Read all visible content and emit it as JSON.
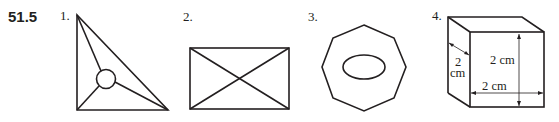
{
  "problem": {
    "number": "51.5"
  },
  "figures": [
    {
      "label": "1.",
      "shape": "triangle-with-inscribed-circle-and-lines-to-vertices"
    },
    {
      "label": "2.",
      "shape": "rectangle-with-diagonals"
    },
    {
      "label": "3.",
      "shape": "octagon-with-ellipse"
    },
    {
      "label": "4.",
      "shape": "cube",
      "dimensions": {
        "height": "2 cm",
        "width": "2 cm",
        "depth_value": "2",
        "depth_unit": "cm"
      }
    }
  ],
  "colors": {
    "ink": "#231f20",
    "background": "#ffffff"
  }
}
